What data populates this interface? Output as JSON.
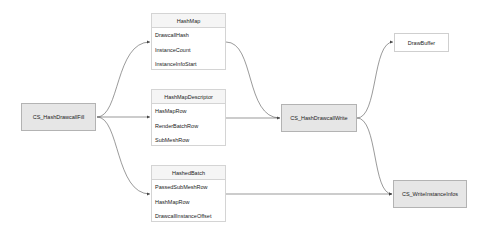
{
  "nodes": {
    "fill": {
      "label": "CS_HashDrawcallFill"
    },
    "write": {
      "label": "CS_HashDrawcallWrite"
    },
    "drawbuffer": {
      "label": "DrawBuffer"
    },
    "writeinfos": {
      "label": "CS_WriteInstanceInfos"
    }
  },
  "tables": [
    {
      "title": "HashMap",
      "rows": [
        "DrawcallHash",
        "InstanceCount",
        "InstanceInfoStart"
      ]
    },
    {
      "title": "HashMapDescriptor",
      "rows": [
        "HasMapRow",
        "RenderBatchRow",
        "SubMeshRow"
      ]
    },
    {
      "title": "HashedBatch",
      "rows": [
        "PassedSubMeshRow",
        "HashMapRow",
        "DrawcallInstanceOffset"
      ]
    }
  ],
  "colors": {
    "process_fill": "#e6e6e6",
    "edge": "#555555"
  }
}
